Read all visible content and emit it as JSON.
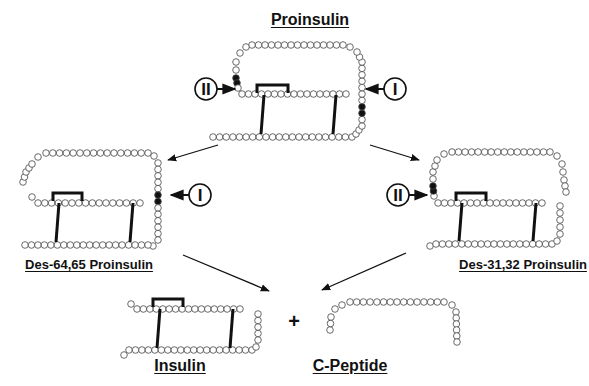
{
  "title": "Proinsulin",
  "colors": {
    "ink": "#111111",
    "residue_fill": "#ffffff",
    "cleavage_site": "#111111",
    "background": "#ffffff"
  },
  "molecules": [
    {
      "id": "proinsulin",
      "label": "Proinsulin",
      "label_x": 310,
      "label_y": 11,
      "font_size": 16
    },
    {
      "id": "des-64-65",
      "label": "Des-64,65 Proinsulin",
      "label_x": 89,
      "label_y": 257,
      "font_size": 13
    },
    {
      "id": "des-31-32",
      "label": "Des-31,32  Proinsulin",
      "label_x": 523,
      "label_y": 257,
      "font_size": 13
    },
    {
      "id": "insulin",
      "label": "Insulin",
      "label_x": 180,
      "label_y": 357,
      "font_size": 16
    },
    {
      "id": "c-peptide",
      "label": "C-Peptide",
      "label_x": 350,
      "label_y": 357,
      "font_size": 16
    }
  ],
  "cleavage_markers": [
    {
      "id": "proinsulin-site-II",
      "text": "II",
      "cx": 206,
      "cy": 89
    },
    {
      "id": "proinsulin-site-I",
      "text": "I",
      "cx": 395,
      "cy": 89
    },
    {
      "id": "des64-site-I",
      "text": "I",
      "cx": 200,
      "cy": 195
    },
    {
      "id": "des31-site-II",
      "text": "II",
      "cx": 398,
      "cy": 195
    }
  ],
  "operator": {
    "text": "+",
    "x": 294,
    "y": 321
  }
}
